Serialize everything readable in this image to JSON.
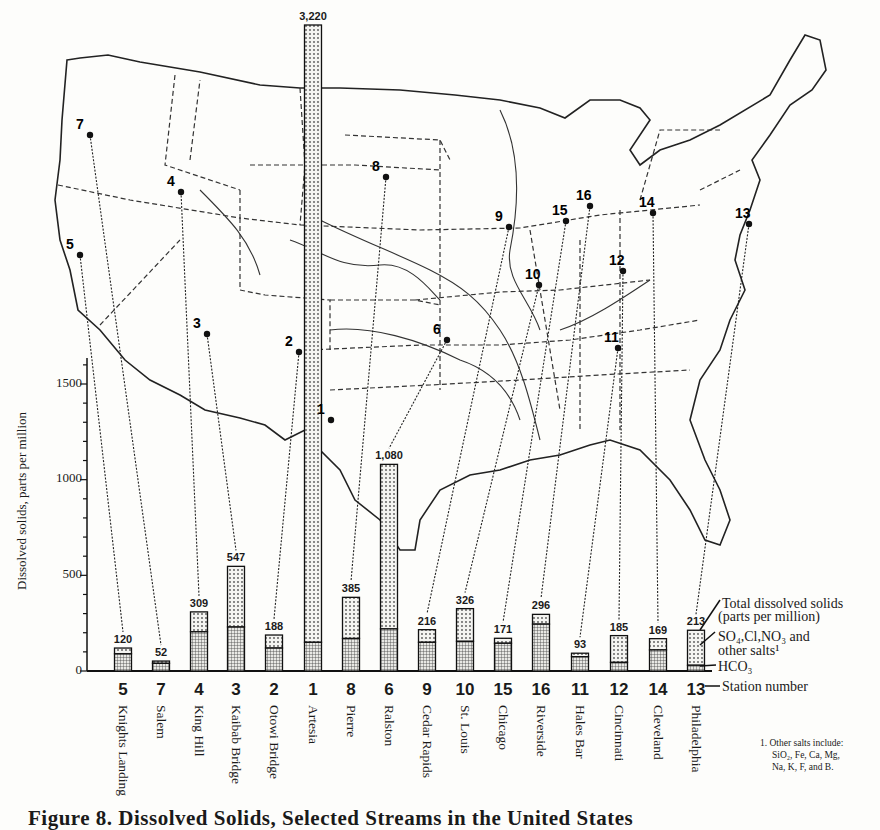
{
  "caption": "Figure 8. Dissolved Solids, Selected Streams in the United States",
  "y_axis": {
    "label": "Dissolved solids, parts per million",
    "ticks": [
      "0",
      "500",
      "1000",
      "1500"
    ]
  },
  "legend": {
    "total": "Total dissolved solids",
    "total_sub": "(parts per million)",
    "salts": "SO₄,Cl,NO₃ and",
    "salts_sub": "other salts¹",
    "hco3": "HCO₃",
    "station": "Station number"
  },
  "footnote": {
    "line1": "1. Other salts include:",
    "line2": "SiO₂, Fe, Ca, Mg,",
    "line3": "Na, K, F, and B."
  },
  "stations": [
    {
      "num": "5",
      "name": "Knights Landing",
      "total_label": "120"
    },
    {
      "num": "7",
      "name": "Salem",
      "total_label": "52"
    },
    {
      "num": "4",
      "name": "King Hill",
      "total_label": "309"
    },
    {
      "num": "3",
      "name": "Kaibab Bridge",
      "total_label": "547"
    },
    {
      "num": "2",
      "name": "Otowi Bridge",
      "total_label": "188"
    },
    {
      "num": "1",
      "name": "Artesia",
      "total_label": "3,220"
    },
    {
      "num": "8",
      "name": "Pierre",
      "total_label": "385"
    },
    {
      "num": "6",
      "name": "Ralston",
      "total_label": "1,080"
    },
    {
      "num": "9",
      "name": "Cedar Rapids",
      "total_label": "216"
    },
    {
      "num": "10",
      "name": "St. Louis",
      "total_label": "326"
    },
    {
      "num": "15",
      "name": "Chicago",
      "total_label": "171"
    },
    {
      "num": "16",
      "name": "Riverside",
      "total_label": "296"
    },
    {
      "num": "11",
      "name": "Hales Bar",
      "total_label": "93"
    },
    {
      "num": "12",
      "name": "Cincinnati",
      "total_label": "185"
    },
    {
      "num": "14",
      "name": "Cleveland",
      "total_label": "169"
    },
    {
      "num": "13",
      "name": "Philadelphia",
      "total_label": "213"
    }
  ],
  "chart_data": {
    "type": "bar",
    "stacked": true,
    "title": "Figure 8. Dissolved Solids, Selected Streams in the United States",
    "xlabel": "Station number",
    "ylabel": "Dissolved solids, parts per million",
    "ylim": [
      0,
      1600
    ],
    "yticks": [
      0,
      500,
      1000,
      1500
    ],
    "grid": false,
    "legend_position": "right",
    "categories": [
      "5 Knights Landing",
      "7 Salem",
      "4 King Hill",
      "3 Kaibab Bridge",
      "2 Otowi Bridge",
      "1 Artesia",
      "8 Pierre",
      "6 Ralston",
      "9 Cedar Rapids",
      "10 St. Louis",
      "15 Chicago",
      "16 Riverside",
      "11 Hales Bar",
      "12 Cincinnati",
      "14 Cleveland",
      "13 Philadelphia"
    ],
    "station_numbers": [
      5,
      7,
      4,
      3,
      2,
      1,
      8,
      6,
      9,
      10,
      15,
      16,
      11,
      12,
      14,
      13
    ],
    "totals": [
      120,
      52,
      309,
      547,
      188,
      3220,
      385,
      1080,
      216,
      326,
      171,
      296,
      93,
      185,
      169,
      213
    ],
    "series": [
      {
        "name": "HCO3",
        "values": [
          90,
          40,
          205,
          230,
          120,
          150,
          170,
          220,
          150,
          155,
          145,
          245,
          75,
          45,
          110,
          30
        ]
      },
      {
        "name": "SO4, Cl, NO3 and other salts",
        "values": [
          30,
          12,
          104,
          317,
          68,
          3070,
          215,
          860,
          66,
          171,
          26,
          51,
          18,
          140,
          59,
          183
        ]
      }
    ],
    "annotations": [
      "Artesia bar extends beyond axis (3,220)",
      "1. Other salts include: SiO2, Fe, Ca, Mg, Na, K, F, and B."
    ],
    "map": "Outline map of the conterminous United States with state boundaries, major rivers and numbered sampling stations 1–16 connected by dotted leader lines to bars"
  },
  "colors": {
    "ink": "#1a1a1a",
    "paper": "#fdfdfb",
    "salts_fill": "#d9d9d6",
    "hco3_fill": "#9d9d99"
  }
}
